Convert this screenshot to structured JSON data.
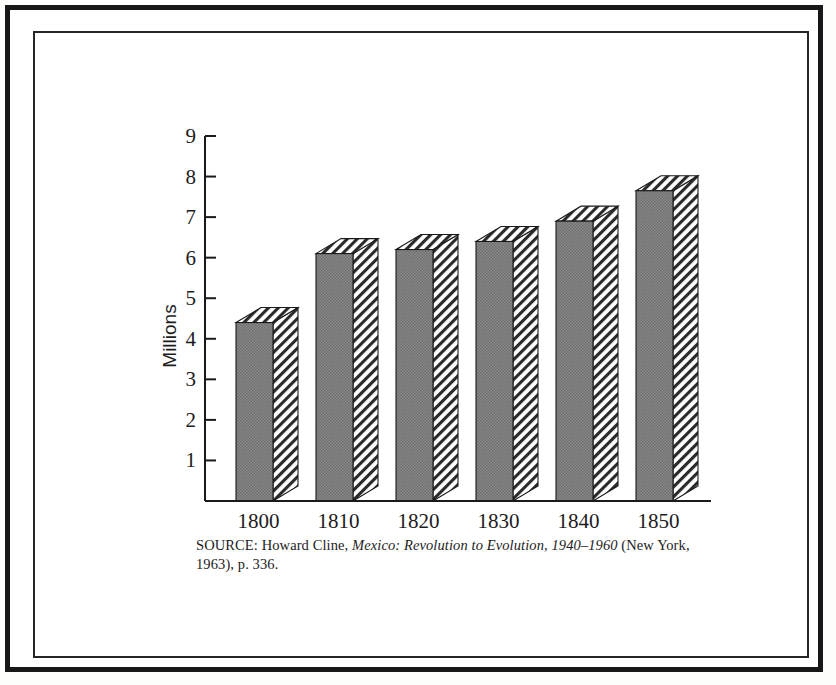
{
  "figure": {
    "frame_color": "#171717",
    "inner_frame_color": "#262626",
    "background": "#ffffff"
  },
  "axis": {
    "y_title": "Millions",
    "y_ticks": [
      "1",
      "2",
      "3",
      "4",
      "5",
      "6",
      "7",
      "8",
      "9"
    ],
    "x_ticks": [
      "1800",
      "1810",
      "1820",
      "1830",
      "1840",
      "1850"
    ]
  },
  "source": {
    "prefix": "SOURCE: Howard Cline, ",
    "italic_title": "Mexico: Revolution to Evolution, 1940–1960",
    "suffix": " (New York, 1963), p. 336."
  },
  "chart_data": {
    "type": "bar",
    "title": "",
    "subtitle": "",
    "xlabel": "",
    "ylabel": "Millions",
    "categories": [
      "1800",
      "1810",
      "1820",
      "1830",
      "1840",
      "1850"
    ],
    "values": [
      4.4,
      6.1,
      6.2,
      6.4,
      6.9,
      7.65
    ],
    "ylim": [
      0,
      9
    ],
    "ytick_values": [
      1,
      2,
      3,
      4,
      5,
      6,
      7,
      8,
      9
    ],
    "grid": false,
    "legend": null,
    "style": {
      "bar_fill": "#808080",
      "bar_edge": "#1a1a1a",
      "side_fill": "hatch-diagonal",
      "three_d": true
    },
    "annotations": []
  }
}
